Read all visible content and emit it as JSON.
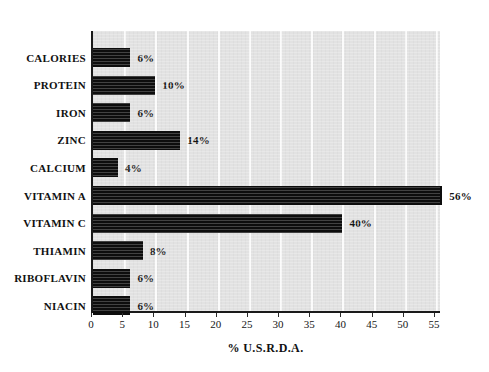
{
  "chart_data": {
    "type": "bar",
    "orientation": "horizontal",
    "title": "",
    "xlabel": "% U.S.R.D.A.",
    "ylabel": "",
    "xlim": [
      0,
      55
    ],
    "xtick_step": 5,
    "xticks": [
      "0",
      "5",
      "10",
      "15",
      "20",
      "25",
      "30",
      "35",
      "40",
      "45",
      "50",
      "55"
    ],
    "grid": "vertical-only",
    "legend": "none",
    "categories": [
      "CALORIES",
      "PROTEIN",
      "IRON",
      "ZINC",
      "CALCIUM",
      "VITAMIN A",
      "VITAMIN C",
      "THIAMIN",
      "RIBOFLAVIN",
      "NIACIN"
    ],
    "values": [
      6,
      10,
      6,
      14,
      4,
      56,
      40,
      8,
      6,
      6
    ],
    "data_labels": [
      "6%",
      "10%",
      "6%",
      "14%",
      "4%",
      "56%",
      "40%",
      "8%",
      "6%",
      "6%"
    ],
    "colors": {
      "bar": "#0d0d0d",
      "plot_background": "#e2e2e2",
      "gridline": "#fbfbfb",
      "axis": "#1a1a1a",
      "text": "#111111",
      "page_background": "#ffffff"
    }
  }
}
